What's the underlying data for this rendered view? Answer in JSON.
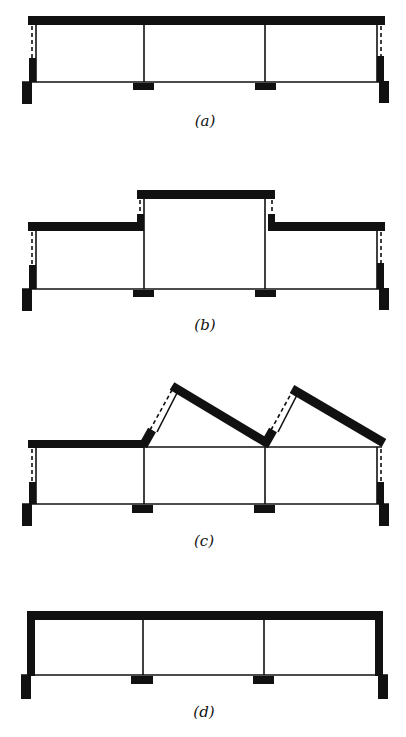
{
  "figure": {
    "panels": [
      {
        "id": "a",
        "label": "(a)",
        "roof_type": "flat roof with side clerestory windows"
      },
      {
        "id": "b",
        "label": "(b)",
        "roof_type": "raised center bay with clerestory windows"
      },
      {
        "id": "c",
        "label": "(c)",
        "roof_type": "sawtooth (north-light) roof"
      },
      {
        "id": "d",
        "label": "(d)",
        "roof_type": "flat roof, solid walls"
      }
    ],
    "colors": {
      "ink": "#111111",
      "background": "#ffffff"
    }
  }
}
